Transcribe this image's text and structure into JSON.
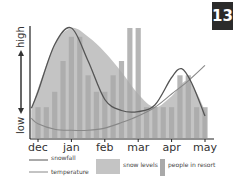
{
  "badge": {
    "number": "13"
  },
  "chart_data": {
    "type": "bar",
    "title": "",
    "xlabel": "",
    "ylabel": "",
    "y_axis": {
      "low_label": "low",
      "high_label": "high"
    },
    "categories": [
      "dec",
      "jan",
      "feb",
      "mar",
      "apr",
      "may"
    ],
    "ylim": [
      0,
      100
    ],
    "grid": false,
    "legend_position": "bottom",
    "series": [
      {
        "name": "people in resort",
        "type": "bar",
        "color": "#a9a9a9",
        "x": [
          0.0,
          0.25,
          0.5,
          0.75,
          1.0,
          1.25,
          1.5,
          1.75,
          2.0,
          2.25,
          2.5,
          2.75,
          3.0,
          3.25,
          3.5,
          3.75,
          4.0,
          4.25,
          4.5,
          4.75,
          5.0
        ],
        "values": [
          28,
          28,
          42,
          70,
          92,
          92,
          57,
          42,
          42,
          57,
          70,
          100,
          100,
          28,
          28,
          28,
          28,
          57,
          57,
          28,
          28
        ]
      },
      {
        "name": "snow levels",
        "type": "area",
        "color": "#c4c4c4",
        "x": [
          -0.2,
          0.0,
          0.5,
          1.0,
          1.5,
          2.0,
          2.5,
          3.0,
          3.5,
          4.0,
          4.5,
          5.0,
          5.05
        ],
        "values": [
          25,
          45,
          85,
          100,
          92,
          78,
          60,
          40,
          28,
          38,
          52,
          25,
          20
        ]
      },
      {
        "name": "snowfall",
        "type": "line",
        "color": "#555555",
        "x": [
          -0.2,
          0.0,
          0.5,
          1.0,
          1.5,
          2.0,
          2.5,
          3.0,
          3.5,
          4.0,
          4.3,
          4.6,
          5.0
        ],
        "values": [
          27,
          42,
          85,
          100,
          70,
          35,
          25,
          24,
          30,
          55,
          63,
          50,
          20
        ]
      },
      {
        "name": "temperature",
        "type": "line",
        "color": "#888888",
        "x": [
          -0.2,
          0.0,
          0.5,
          1.0,
          1.5,
          2.0,
          2.5,
          3.0,
          3.5,
          4.0,
          4.5,
          5.0
        ],
        "values": [
          18,
          13,
          8,
          7,
          7,
          9,
          14,
          20,
          28,
          40,
          52,
          66
        ]
      }
    ]
  },
  "legend": {
    "snowfall": "snowfall",
    "temperature": "temperature",
    "snow_levels": "snow levels",
    "people_in_resort": "people in resort"
  }
}
